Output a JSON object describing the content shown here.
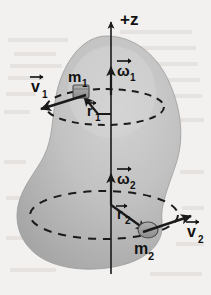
{
  "figure": {
    "background_color": "#f3f1ef",
    "body_fill": "#bcbcbc",
    "body_fill_light": "#cecece",
    "body_fill_dark": "#a9a9a9",
    "ink_color": "#1a1a1a",
    "axis": {
      "label": "+z",
      "name": "z-axis",
      "direction": "up"
    },
    "vectors": [
      {
        "name": "omega-1",
        "label": "ω",
        "subscript": "1",
        "kind": "angular-velocity",
        "direction": "up"
      },
      {
        "name": "v-1",
        "label": "v",
        "subscript": "1",
        "kind": "linear-velocity",
        "direction": "down-left"
      },
      {
        "name": "r-1",
        "label": "r",
        "subscript": "1",
        "kind": "radius",
        "direction": "left"
      },
      {
        "name": "omega-2",
        "label": "ω",
        "subscript": "2",
        "kind": "angular-velocity",
        "direction": "up"
      },
      {
        "name": "v-2",
        "label": "v",
        "subscript": "2",
        "kind": "linear-velocity",
        "direction": "right"
      },
      {
        "name": "r-2",
        "label": "r",
        "subscript": "2",
        "kind": "radius",
        "direction": "down-right"
      }
    ],
    "masses": [
      {
        "name": "mass-1",
        "label": "m",
        "subscript": "1"
      },
      {
        "name": "mass-2",
        "label": "m",
        "subscript": "2"
      }
    ],
    "orbits": [
      {
        "name": "orbit-circle-1",
        "style": "dashed"
      },
      {
        "name": "orbit-circle-2",
        "style": "dashed"
      }
    ]
  },
  "labels": {
    "z_axis": "+z",
    "omega_1": "ω",
    "omega_1_sub": "1",
    "omega_2": "ω",
    "omega_2_sub": "2",
    "v_1": "v",
    "v_1_sub": "1",
    "v_2": "v",
    "v_2_sub": "2",
    "r_1": "r",
    "r_1_sub": "1",
    "r_2": "r",
    "r_2_sub": "2",
    "m_1": "m",
    "m_1_sub": "1",
    "m_2": "m",
    "m_2_sub": "2"
  }
}
